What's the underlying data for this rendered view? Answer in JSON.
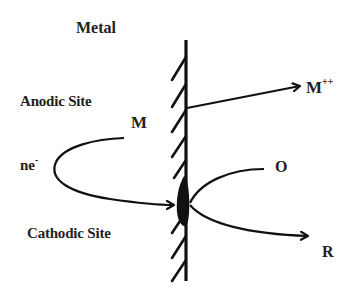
{
  "diagram": {
    "type": "corrosion-electrochemical-cell",
    "labels": {
      "metal": "Metal",
      "anodic_site": "Anodic Site",
      "cathodic_site": "Cathodic Site",
      "metal_atom": "M",
      "metal_ion_base": "M",
      "metal_ion_charge": "++",
      "electrons_base": "ne",
      "electrons_charge": "-",
      "oxidant": "O",
      "reduced": "R"
    },
    "arrows": [
      {
        "from": "metal-surface-anodic",
        "to": "M++",
        "meaning": "metal oxidation / dissolution"
      },
      {
        "from": "M",
        "to": "cathodic-site",
        "via": "ne-",
        "meaning": "electron flow from anode to cathode"
      },
      {
        "from": "O",
        "to": "R",
        "via": "cathodic-site",
        "meaning": "reduction of oxidant"
      }
    ],
    "colors": {
      "stroke": "#111111",
      "text": "#222222",
      "background": "#ffffff"
    }
  }
}
